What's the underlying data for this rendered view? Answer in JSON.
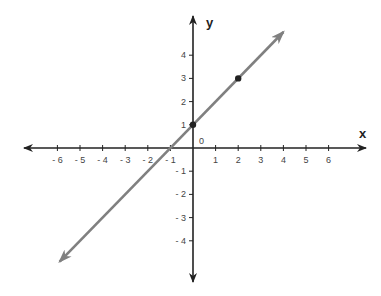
{
  "chart_data": {
    "type": "line",
    "title": "",
    "xlabel": "x",
    "ylabel": "y",
    "origin_label": "0",
    "xlim": [
      -6,
      6
    ],
    "ylim": [
      -4,
      4
    ],
    "x_ticks": [
      -6,
      -5,
      -4,
      -3,
      -2,
      -1,
      1,
      2,
      3,
      4,
      5,
      6
    ],
    "y_ticks": [
      -4,
      -3,
      -2,
      -1,
      1,
      2,
      3,
      4
    ],
    "grid": false,
    "series": [
      {
        "name": "y = x + 1",
        "slope": 1,
        "intercept": 1,
        "line_color": "#808080",
        "x": [
          -5.9,
          4
        ],
        "y": [
          -4.9,
          5
        ],
        "arrows_both_ends": true
      }
    ],
    "points": [
      {
        "x": 0,
        "y": 1,
        "color": "#222222"
      },
      {
        "x": 2,
        "y": 3,
        "color": "#222222"
      }
    ]
  },
  "labels": {
    "x_axis": "x",
    "y_axis": "y",
    "origin": "0",
    "x_ticks": [
      "- 6",
      "- 5",
      "- 4",
      "- 3",
      "- 2",
      "- 1",
      "1",
      "2",
      "3",
      "4",
      "5",
      "6"
    ],
    "y_ticks_pos": [
      "1",
      "2",
      "3",
      "4"
    ],
    "y_ticks_neg": [
      "- 1",
      "- 2",
      "- 3",
      "- 4"
    ]
  }
}
